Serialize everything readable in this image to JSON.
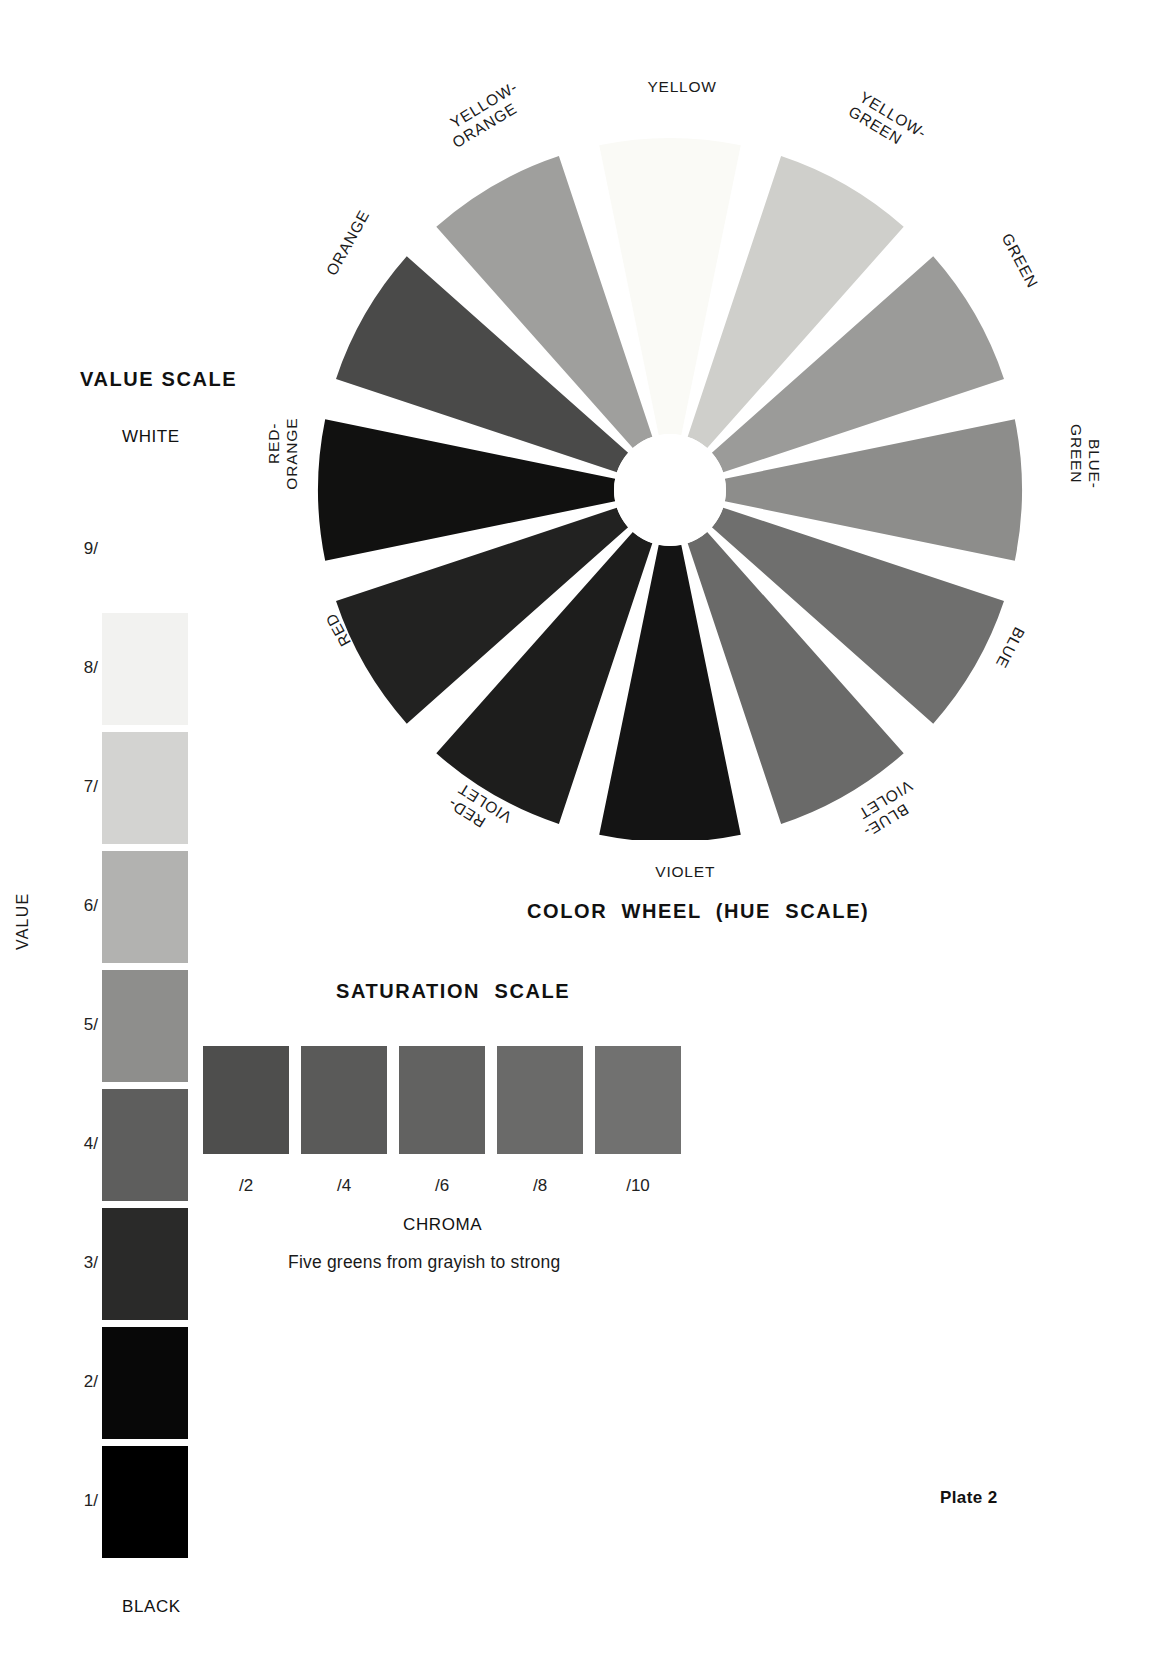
{
  "plate": {
    "caption": "Plate 2"
  },
  "value_scale": {
    "title": "VALUE SCALE",
    "top_label": "WHITE",
    "bottom_label": "BLACK",
    "axis_title": "VALUE",
    "steps": [
      {
        "tick": "9/",
        "color": "#ffffff"
      },
      {
        "tick": "8/",
        "color": "#f2f2f0"
      },
      {
        "tick": "7/",
        "color": "#d3d3d1"
      },
      {
        "tick": "6/",
        "color": "#b2b2b0"
      },
      {
        "tick": "5/",
        "color": "#8e8e8c"
      },
      {
        "tick": "4/",
        "color": "#5e5e5d"
      },
      {
        "tick": "3/",
        "color": "#2a2a29"
      },
      {
        "tick": "2/",
        "color": "#080808"
      },
      {
        "tick": "1/",
        "color": "#000000"
      }
    ]
  },
  "saturation_scale": {
    "title": "SATURATION  SCALE",
    "axis_title": "CHROMA",
    "caption": "Five greens from grayish to strong",
    "steps": [
      {
        "tick": "/2",
        "color": "#4e4e4d"
      },
      {
        "tick": "/4",
        "color": "#5a5a59"
      },
      {
        "tick": "/6",
        "color": "#626261"
      },
      {
        "tick": "/8",
        "color": "#6a6a69"
      },
      {
        "tick": "/10",
        "color": "#717170"
      }
    ]
  },
  "color_wheel": {
    "title": "COLOR  WHEEL  (HUE  SCALE)",
    "hub_color": "#ffffff",
    "segments": [
      {
        "label": "YELLOW",
        "color": "#fafaf6"
      },
      {
        "label": "YELLOW-\nGREEN",
        "color": "#cfcfcb"
      },
      {
        "label": "GREEN",
        "color": "#9b9b99"
      },
      {
        "label": "BLUE-\nGREEN",
        "color": "#8d8d8b"
      },
      {
        "label": "BLUE",
        "color": "#6f6f6e"
      },
      {
        "label": "BLUE-\nVIOLET",
        "color": "#6a6a69"
      },
      {
        "label": "VIOLET",
        "color": "#141414"
      },
      {
        "label": "RED-\nVIOLET",
        "color": "#1d1d1c"
      },
      {
        "label": "RED",
        "color": "#222221"
      },
      {
        "label": "RED-\nORANGE",
        "color": "#111110"
      },
      {
        "label": "ORANGE",
        "color": "#4a4a49"
      },
      {
        "label": "YELLOW-\nORANGE",
        "color": "#9f9f9d"
      }
    ]
  }
}
